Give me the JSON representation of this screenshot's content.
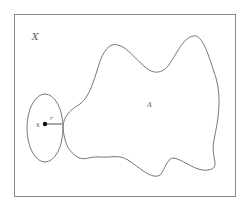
{
  "diagram": {
    "labels": {
      "space": "X",
      "set": "A",
      "point": "x",
      "radius": "r"
    },
    "colors": {
      "stroke": "#777777",
      "frame": "#888888",
      "point": "#111111"
    }
  }
}
